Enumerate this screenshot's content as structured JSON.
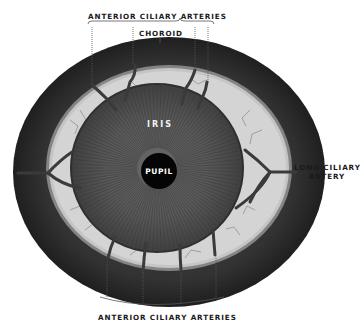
{
  "figure": {
    "labels": {
      "top_arteries": "ANTERIOR CILIARY ARTERIES",
      "choroid": "CHOROID",
      "iris": "IRIS",
      "pupil": "PUPIL",
      "long_ciliary_line1": "LONG CILIARY",
      "long_ciliary_line2": "ARTERY",
      "bottom_arteries": "ANTERIOR CILIARY ARTERIES"
    },
    "colors": {
      "choroid_dark": "#2b2b2b",
      "ciliary_light": "#d6d6d6",
      "iris_gray": "#555555",
      "pupil_black": "#050505",
      "vessel": "#3a3a3a",
      "label_text": "#1a1a1a"
    }
  }
}
